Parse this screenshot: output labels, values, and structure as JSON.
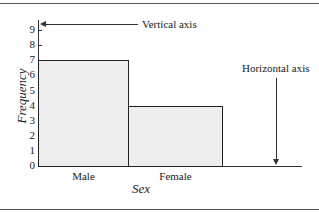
{
  "chart_data": {
    "type": "bar",
    "title": "",
    "xlabel": "Sex",
    "ylabel": "Frequency",
    "categories": [
      "Male",
      "Female"
    ],
    "values": [
      7,
      4
    ],
    "ylim": [
      0,
      9
    ],
    "yticks": [
      "0",
      "1",
      "2",
      "3",
      "4",
      "5",
      "6",
      "7",
      "8",
      "9"
    ],
    "grid": false,
    "legend": null,
    "annotations": [
      {
        "text": "Vertical axis",
        "points_to": "y-axis"
      },
      {
        "text": "Horizontal axis",
        "points_to": "x-axis"
      }
    ],
    "bar_fill": "#eeeeee",
    "bar_edge": "#222222"
  }
}
